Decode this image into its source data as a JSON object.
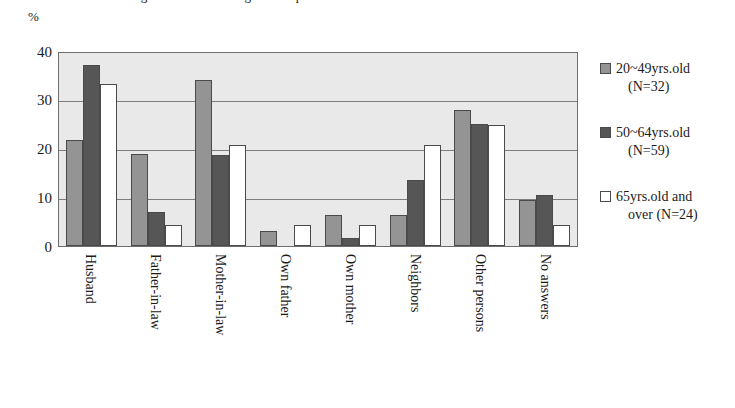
{
  "chart_data": {
    "type": "bar",
    "title": "",
    "xlabel": "",
    "ylabel": "%",
    "ylim": [
      0,
      40
    ],
    "yticks": [
      0,
      10,
      20,
      30,
      40
    ],
    "grid": true,
    "legend_position": "right",
    "categories": [
      "Husband",
      "Father-in-law",
      "Mother-in-law",
      "Own father",
      "Own mother",
      "Neighbors",
      "Other persons",
      "No answers"
    ],
    "series": [
      {
        "name": "20~49yrs.old (N=32)",
        "name_line1": "20~49yrs.old",
        "name_line2": "(N=32)",
        "color": "#949494",
        "values": [
          22.0,
          19.0,
          34.5,
          3.2,
          6.5,
          6.5,
          28.2,
          9.5
        ]
      },
      {
        "name": "50~64yrs.old (N=59)",
        "name_line1": "50~64yrs.old",
        "name_line2": "(N=59)",
        "color": "#565656",
        "values": [
          37.5,
          7.0,
          18.8,
          0.0,
          1.7,
          13.7,
          25.3,
          10.5
        ]
      },
      {
        "name": "65yrs.old and over (N=24)",
        "name_line1": "65yrs.old and",
        "name_line2": "over (N=24)",
        "color": "#ffffff",
        "values": [
          33.5,
          4.3,
          21.0,
          4.4,
          4.4,
          21.0,
          25.0,
          4.4
        ]
      }
    ]
  },
  "axis": {
    "unit_label": "%"
  },
  "title_partial": "Figure 1  Persons living with respondents"
}
